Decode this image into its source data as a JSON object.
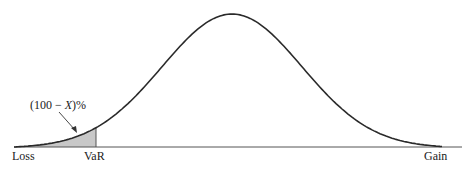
{
  "chart_data": {
    "type": "area",
    "title": "",
    "xlabel": "",
    "ylabel": "",
    "x_axis_labels": {
      "left": "Loss",
      "marker": "VaR",
      "right": "Gain"
    },
    "annotation": {
      "text_prefix": "(100 − ",
      "text_var": "X",
      "text_suffix": ")%",
      "points_to": "shaded tail area left of VaR"
    },
    "distribution": {
      "kind": "normal",
      "mean_px": 232,
      "sigma_px": 70,
      "peak_y_px": 13,
      "baseline_y_px": 147,
      "x_start_px": 14,
      "x_end_px": 442,
      "var_x_px": 96
    },
    "shaded_region": {
      "from": "Loss",
      "to": "VaR",
      "color": "#c8c8c8"
    },
    "grid": false,
    "legend": null
  },
  "colors": {
    "curve": "#2a2a2a",
    "axis": "#555555",
    "shade": "#c8c8c8",
    "text": "#222222"
  }
}
